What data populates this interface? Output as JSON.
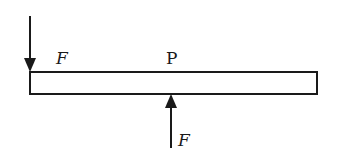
{
  "diagram": {
    "type": "force-diagram",
    "rod": {
      "x": 30,
      "y": 72,
      "width": 287,
      "height": 22
    },
    "labels": {
      "force_top": "F",
      "point": "P",
      "force_bottom": "F"
    },
    "forces": [
      {
        "name": "F",
        "direction": "down",
        "location": "left end, top of rod"
      },
      {
        "name": "F",
        "direction": "up",
        "location": "point P, bottom of rod"
      }
    ],
    "colors": {
      "stroke": "#1a1a1a",
      "background": "#ffffff"
    }
  }
}
